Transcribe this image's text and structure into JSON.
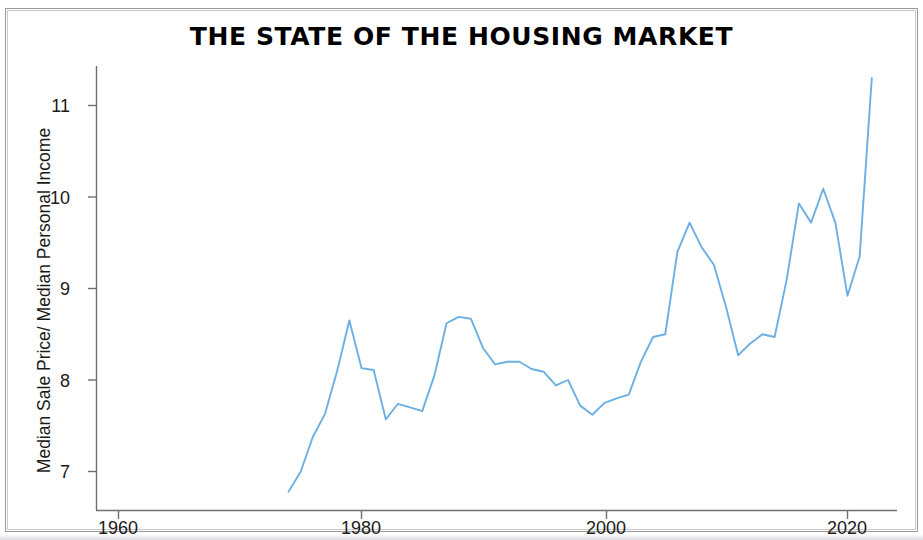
{
  "title": "THE STATE OF THE HOUSING MARKET",
  "y_axis_title": "Median Sale Price/ Median Personal Income",
  "y_ticks": [
    "7",
    "8",
    "9",
    "10",
    "11"
  ],
  "x_ticks": [
    "1960",
    "1980",
    "2000",
    "2020"
  ],
  "colors": {
    "line": "#6CB0E3",
    "axis": "#6f6f6f",
    "text": "#1a1a1a",
    "background": "#ffffff",
    "border": "#9a9a9a"
  },
  "chart_data": {
    "type": "line",
    "title": "THE STATE OF THE HOUSING MARKET",
    "xlabel": "",
    "ylabel": "Median Sale Price/ Median Personal Income",
    "xlim": [
      1958,
      2024
    ],
    "ylim": [
      6.6,
      11.45
    ],
    "xticks": [
      1960,
      1980,
      2000,
      2020
    ],
    "yticks": [
      7,
      8,
      9,
      10,
      11
    ],
    "grid": false,
    "legend": false,
    "series": [
      {
        "name": "Median Sale Price / Median Personal Income",
        "color": "#6CB0E3",
        "x": [
          1974,
          1975,
          1976,
          1977,
          1978,
          1979,
          1980,
          1981,
          1982,
          1983,
          1984,
          1985,
          1986,
          1987,
          1988,
          1989,
          1990,
          1991,
          1992,
          1993,
          1994,
          1995,
          1996,
          1997,
          1998,
          1999,
          2000,
          2001,
          2002,
          2003,
          2004,
          2005,
          2006,
          2007,
          2008,
          2009,
          2010,
          2011,
          2012,
          2013,
          2014,
          2015,
          2016,
          2017,
          2018,
          2019,
          2020,
          2021,
          2022
        ],
        "y": [
          6.78,
          7.0,
          7.38,
          7.63,
          8.1,
          8.65,
          8.13,
          8.11,
          7.57,
          7.74,
          7.7,
          7.66,
          8.05,
          8.62,
          8.69,
          8.67,
          8.35,
          8.17,
          8.2,
          8.2,
          8.12,
          8.09,
          7.94,
          8.0,
          7.72,
          7.62,
          7.75,
          7.8,
          7.84,
          8.2,
          8.47,
          8.5,
          9.4,
          9.72,
          9.45,
          9.26,
          8.8,
          8.27,
          8.4,
          8.5,
          8.47,
          9.1,
          9.93,
          9.72,
          10.09,
          9.72,
          8.92,
          9.35,
          11.3
        ]
      }
    ],
    "data_start_year": 1974,
    "data_end_year": 2022,
    "min_value": 6.78,
    "max_value": 11.3
  }
}
